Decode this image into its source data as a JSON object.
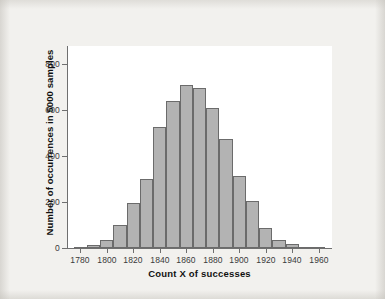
{
  "chart_data": {
    "type": "bar",
    "title": "",
    "xlabel": "Count X of successes",
    "ylabel": "Number of occurrences in 5000 samples",
    "xlim": [
      1770,
      1970
    ],
    "ylim": [
      0,
      880
    ],
    "grid": false,
    "legend": null,
    "bin_width": 10,
    "xtick_labels": [
      "1780",
      "1800",
      "1820",
      "1840",
      "1860",
      "1880",
      "1900",
      "1920",
      "1940",
      "1960"
    ],
    "xtick_values": [
      1780,
      1800,
      1820,
      1840,
      1860,
      1880,
      1900,
      1920,
      1940,
      1960
    ],
    "ytick_labels": [
      "0",
      "200",
      "400",
      "600",
      "800"
    ],
    "ytick_values": [
      0,
      200,
      400,
      600,
      800
    ],
    "categories": [
      1780,
      1790,
      1800,
      1810,
      1820,
      1830,
      1840,
      1850,
      1860,
      1870,
      1880,
      1890,
      1900,
      1910,
      1920,
      1930,
      1940,
      1950,
      1960
    ],
    "values": [
      5,
      12,
      35,
      100,
      198,
      300,
      528,
      640,
      712,
      695,
      612,
      475,
      312,
      205,
      85,
      35,
      18,
      5,
      2
    ],
    "bar_fill_color": "#b3b3b3",
    "bar_edge_color": "#6b6b6b",
    "axis_color": "#6f6f6f",
    "plot_background": "#ffffff",
    "figure_background": "#f2f1ee"
  }
}
